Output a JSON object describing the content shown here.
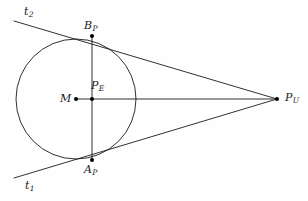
{
  "figure": {
    "background_color": "#fefefe",
    "stroke_color": "#1a1a1a",
    "point_color": "#000000",
    "stroke_width": 0.9
  },
  "labels": {
    "tangent_upper": {
      "base": "t",
      "subscript": "2"
    },
    "tangent_lower": {
      "base": "t",
      "subscript": "1"
    },
    "tangent_point_upper": {
      "base": "B",
      "subscript": "P"
    },
    "tangent_point_lower": {
      "base": "A",
      "subscript": "P"
    },
    "center": {
      "base": "M",
      "subscript": ""
    },
    "chord_midpoint": {
      "base": "P",
      "subscript": "E"
    },
    "external_point": {
      "base": "P",
      "subscript": "U"
    }
  },
  "geometry": {
    "circle": {
      "cx": 76,
      "cy": 99,
      "r": 60
    },
    "points": {
      "M": {
        "x": 76,
        "y": 99
      },
      "P_E": {
        "x": 92,
        "y": 99
      },
      "B_P": {
        "x": 92,
        "y": 36
      },
      "A_P": {
        "x": 92,
        "y": 160
      },
      "P_U": {
        "x": 277,
        "y": 99
      }
    },
    "segments": {
      "axis_M_to_PU": {
        "x1": 76,
        "y1": 99,
        "x2": 277,
        "y2": 99
      },
      "chord_AP_BP": {
        "x1": 92,
        "y1": 36,
        "x2": 92,
        "y2": 160
      },
      "tangent_t2": {
        "x1": 14,
        "y1": 21,
        "x2": 277,
        "y2": 99
      },
      "tangent_t1": {
        "x1": 14,
        "y1": 178,
        "x2": 277,
        "y2": 99
      }
    },
    "dot_radius": 2.0
  }
}
